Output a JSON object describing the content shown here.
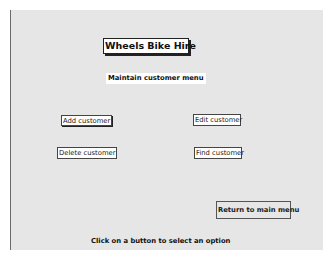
{
  "form": {
    "title": "Wheels Bike Hire",
    "subtitle": "Maintain customer menu",
    "buttons": {
      "add": "Add customer",
      "edit": "Edit customer",
      "delete": "Delete customer",
      "find": "Find customer",
      "return": "Return to main menu"
    },
    "hint": "Click on a button to select an option"
  },
  "colors": {
    "panel_background": "#e6e6e6",
    "button_background": "#ffffff",
    "text": "#111111"
  }
}
